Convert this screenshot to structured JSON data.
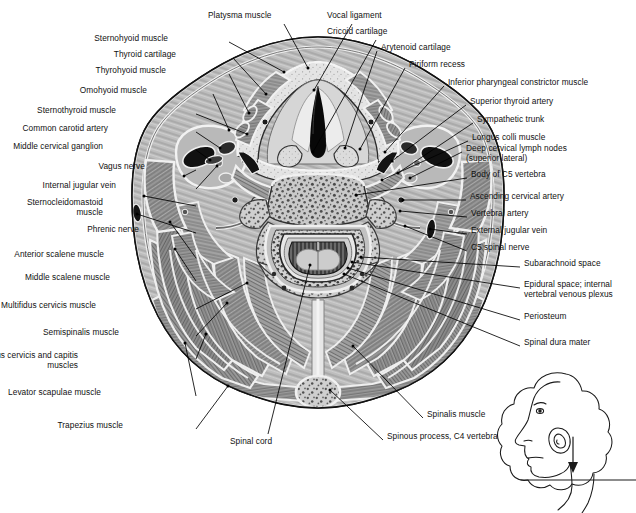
{
  "figure": {
    "type": "anatomical-cross-section",
    "ink": "#111111",
    "leader_color": "#000000"
  },
  "labels_left": [
    {
      "id": "sternohyoid",
      "text": "Sternohyoid muscle",
      "x": 168,
      "y": 38,
      "lx": 229,
      "ly": 42,
      "tx": 284,
      "ty": 72
    },
    {
      "id": "thyroid-cartilage",
      "text": "Thyroid cartilage",
      "x": 176,
      "y": 54,
      "lx": 233,
      "ly": 58,
      "tx": 266,
      "ty": 94
    },
    {
      "id": "thyrohyoid",
      "text": "Thyrohyoid muscle",
      "x": 166,
      "y": 70,
      "lx": 229,
      "ly": 74,
      "tx": 249,
      "ty": 113
    },
    {
      "id": "omohyoid",
      "text": "Omohyoid muscle",
      "x": 147,
      "y": 90,
      "lx": 213,
      "ly": 94,
      "tx": 229,
      "ty": 130
    },
    {
      "id": "sternothyroid",
      "text": "Sternothyroid muscle",
      "x": 116,
      "y": 110,
      "lx": 196,
      "ly": 114,
      "tx": 247,
      "ty": 134
    },
    {
      "id": "common-carotid",
      "text": "Common carotid artery",
      "x": 108,
      "y": 128,
      "lx": 196,
      "ly": 132,
      "tx": 220,
      "ty": 148
    },
    {
      "id": "middle-cerv-gangl",
      "text": "Middle cervical ganglion",
      "x": 103,
      "y": 146,
      "lx": 196,
      "ly": 150,
      "tx": 210,
      "ty": 160
    },
    {
      "id": "vagus-nerve",
      "text": "Vagus nerve",
      "x": 145,
      "y": 166,
      "lx": 196,
      "ly": 170,
      "tx": 184,
      "ty": 176
    },
    {
      "id": "internal-jugular",
      "text": "Internal jugular vein",
      "x": 116,
      "y": 185,
      "lx": 196,
      "ly": 189,
      "tx": 217,
      "ty": 166
    },
    {
      "id": "sternocleidomastoid",
      "text": "Sternocleidomastoid\nmuscle",
      "x": 103,
      "y": 202,
      "lx": 196,
      "ly": 206,
      "tx": 144,
      "ty": 196
    },
    {
      "id": "phrenic-nerve",
      "text": "Phrenic nerve",
      "x": 139,
      "y": 229,
      "lx": 196,
      "ly": 233,
      "tx": 137,
      "ty": 214
    },
    {
      "id": "anterior-scalene",
      "text": "Anterior scalene muscle",
      "x": 104,
      "y": 254,
      "lx": 196,
      "ly": 258,
      "tx": 170,
      "ty": 222
    },
    {
      "id": "middle-scalene",
      "text": "Middle scalene muscle",
      "x": 110,
      "y": 277,
      "lx": 196,
      "ly": 281,
      "tx": 175,
      "ty": 249
    },
    {
      "id": "multifidus",
      "text": "Multifidus cervicis muscle",
      "x": 96,
      "y": 305,
      "lx": 196,
      "ly": 309,
      "tx": 247,
      "ty": 283
    },
    {
      "id": "semispinalis",
      "text": "Semispinalis muscle",
      "x": 119,
      "y": 332,
      "lx": 196,
      "ly": 336,
      "tx": 227,
      "ty": 303
    },
    {
      "id": "splenius",
      "text": "Splenius cervicis and capitis\nmuscles",
      "x": 78,
      "y": 355,
      "lx": 196,
      "ly": 359,
      "tx": 206,
      "ty": 334
    },
    {
      "id": "levator-scapulae",
      "text": "Levator scapulae muscle",
      "x": 101,
      "y": 392,
      "lx": 196,
      "ly": 396,
      "tx": 185,
      "ty": 343
    },
    {
      "id": "trapezius",
      "text": "Trapezius muscle",
      "x": 123,
      "y": 425,
      "lx": 196,
      "ly": 429,
      "tx": 228,
      "ty": 386
    }
  ],
  "labels_top": [
    {
      "id": "platysma",
      "text": "Platysma muscle",
      "x": 208,
      "y": 15,
      "lx": 284,
      "ly": 24,
      "tx": 308,
      "ty": 68
    },
    {
      "id": "vocal-ligament",
      "text": "Vocal ligament",
      "x": 327,
      "y": 15,
      "lx": 352,
      "ly": 24,
      "tx": 314,
      "ty": 90
    },
    {
      "id": "cricoid",
      "text": "Cricoid cartilage",
      "x": 327,
      "y": 31,
      "lx": 376,
      "ly": 40,
      "tx": 313,
      "ty": 152
    }
  ],
  "labels_right": [
    {
      "id": "arytenoid",
      "text": "Arytenoid cartilage",
      "x": 381,
      "y": 47,
      "lx": 377,
      "ly": 51,
      "tx": 345,
      "ty": 148
    },
    {
      "id": "piriform",
      "text": "Piriform recess",
      "x": 409,
      "y": 64,
      "lx": 405,
      "ly": 68,
      "tx": 360,
      "ty": 149
    },
    {
      "id": "inf-pharyngeal",
      "text": "Inferior pharyngeal constrictor muscle",
      "x": 448,
      "y": 82,
      "lx": 444,
      "ly": 86,
      "tx": 385,
      "ty": 152
    },
    {
      "id": "sup-thyroid-art",
      "text": "Superior thyroid artery",
      "x": 470,
      "y": 101,
      "lx": 466,
      "ly": 105,
      "tx": 392,
      "ty": 161
    },
    {
      "id": "sympathetic-trunk",
      "text": "Sympathetic trunk",
      "x": 477,
      "y": 119,
      "lx": 473,
      "ly": 123,
      "tx": 398,
      "ty": 173
    },
    {
      "id": "longus-colli",
      "text": "Longus colli muscle",
      "x": 472,
      "y": 137,
      "lx": 468,
      "ly": 141,
      "tx": 382,
      "ty": 180
    },
    {
      "id": "deep-cerv-nodes",
      "text": "Deep cervical lymph nodes\n(superior lateral)",
      "x": 466,
      "y": 148,
      "lx": 462,
      "ly": 152,
      "tx": 410,
      "ty": 178
    },
    {
      "id": "body-c5",
      "text": "Body of C5 vertebra",
      "x": 471,
      "y": 174,
      "lx": 467,
      "ly": 178,
      "tx": 356,
      "ty": 195
    },
    {
      "id": "ascending-cerv",
      "text": "Ascending cervical artery",
      "x": 470,
      "y": 196,
      "lx": 466,
      "ly": 200,
      "tx": 403,
      "ty": 200
    },
    {
      "id": "vertebral-artery",
      "text": "Vertebral artery",
      "x": 471,
      "y": 213,
      "lx": 467,
      "ly": 217,
      "tx": 400,
      "ty": 211
    },
    {
      "id": "external-jugular",
      "text": "External jugular vein",
      "x": 471,
      "y": 230,
      "lx": 467,
      "ly": 234,
      "tx": 430,
      "ty": 229
    },
    {
      "id": "c5-spinal-nerve",
      "text": "C5 spinal nerve",
      "x": 471,
      "y": 247,
      "lx": 467,
      "ly": 251,
      "tx": 405,
      "ty": 226
    },
    {
      "id": "subarachnoid",
      "text": "Subarachnoid space",
      "x": 524,
      "y": 263,
      "lx": 520,
      "ly": 267,
      "tx": 361,
      "ty": 257
    },
    {
      "id": "epidural",
      "text": "Epidural space; internal\nvertebral venous plexus",
      "x": 524,
      "y": 284,
      "lx": 520,
      "ly": 288,
      "tx": 352,
      "ty": 262
    },
    {
      "id": "periosteum",
      "text": "Periosteum",
      "x": 524,
      "y": 316,
      "lx": 520,
      "ly": 320,
      "tx": 348,
      "ty": 268
    },
    {
      "id": "spinal-dura",
      "text": "Spinal dura mater",
      "x": 524,
      "y": 342,
      "lx": 520,
      "ly": 346,
      "tx": 344,
      "ty": 274
    }
  ],
  "labels_bottom": [
    {
      "id": "spinalis",
      "text": "Spinalis muscle",
      "x": 427,
      "y": 414,
      "lx": 423,
      "ly": 418,
      "tx": 353,
      "ty": 346
    },
    {
      "id": "spinous-c4",
      "text": "Spinous process, C4 vertebra",
      "x": 387,
      "y": 436,
      "lx": 383,
      "ly": 440,
      "tx": 330,
      "ty": 390
    },
    {
      "id": "spinal-cord",
      "text": "Spinal cord",
      "x": 230,
      "y": 441,
      "lx": 268,
      "ly": 434,
      "tx": 310,
      "ty": 265
    }
  ],
  "inset": {
    "id": "orientation-inset",
    "description": "Lateral head profile with section plane and downward arrow"
  }
}
